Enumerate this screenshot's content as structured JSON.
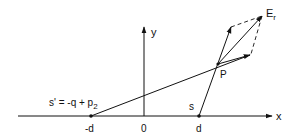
{
  "diagram": {
    "axis_labels": {
      "x": "x",
      "y": "y"
    },
    "tick_labels": {
      "neg_d": "-d",
      "origin": "0",
      "d": "d"
    },
    "point_labels": {
      "P": "P",
      "s": "s",
      "s_prime_base": "s' = -q + p",
      "s_prime_sub": "2",
      "E_base": "E",
      "E_sub": "r"
    },
    "colors": {
      "ink": "#111111",
      "background": "#ffffff"
    }
  }
}
